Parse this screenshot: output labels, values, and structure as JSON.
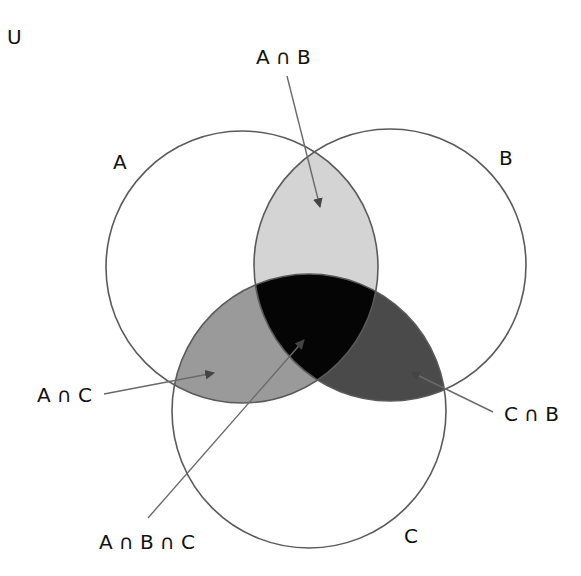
{
  "diagram": {
    "type": "venn-3",
    "universe_label": "U",
    "sets": [
      {
        "id": "A",
        "label": "A",
        "cx": 242,
        "cy": 267,
        "r": 136
      },
      {
        "id": "B",
        "label": "B",
        "cx": 390,
        "cy": 265,
        "r": 136
      },
      {
        "id": "C",
        "label": "C",
        "cx": 309,
        "cy": 411,
        "r": 137
      }
    ],
    "regions": {
      "a_and_b": {
        "label": "A ∩ B",
        "color": "#d4d4d4"
      },
      "a_and_c": {
        "label": "A ∩ C",
        "color": "#9a9a9a"
      },
      "c_and_b": {
        "label": "C ∩ B",
        "color": "#4a4a4a"
      },
      "a_and_b_and_c": {
        "label": "A ∩ B ∩ C",
        "color": "#050505"
      }
    },
    "colors": {
      "outline": "#5a5a5a",
      "arrow": "#6a6a6a",
      "background": "#ffffff",
      "text": "#111111"
    }
  }
}
